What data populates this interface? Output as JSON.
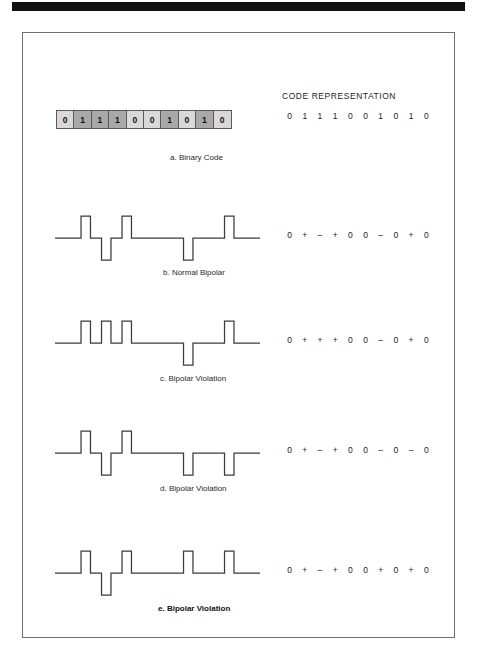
{
  "figure": {
    "top_rule": "black-rule",
    "code_representation_heading": "CODE REPRESENTATION"
  },
  "binary_code": {
    "bits": [
      "0",
      "1",
      "1",
      "1",
      "0",
      "0",
      "1",
      "0",
      "1",
      "0"
    ],
    "code_representation": [
      "0",
      "1",
      "1",
      "1",
      "0",
      "0",
      "1",
      "0",
      "1",
      "0"
    ],
    "caption": "a. Binary Code"
  },
  "panels": [
    {
      "id": "b",
      "caption": "b. Normal Bipolar",
      "symbols": [
        "0",
        "+",
        "–",
        "+",
        "0",
        "0",
        "–",
        "0",
        "+",
        "0"
      ],
      "levels": [
        0,
        1,
        -1,
        1,
        0,
        0,
        -1,
        0,
        1,
        0
      ]
    },
    {
      "id": "c",
      "caption": "c. Bipolar Violation",
      "symbols": [
        "0",
        "+",
        "+",
        "+",
        "0",
        "0",
        "–",
        "0",
        "+",
        "0"
      ],
      "levels": [
        0,
        1,
        1,
        1,
        0,
        0,
        -1,
        0,
        1,
        0
      ]
    },
    {
      "id": "d",
      "caption": "d. Bipolar Violation",
      "symbols": [
        "0",
        "+",
        "–",
        "+",
        "0",
        "0",
        "–",
        "0",
        "–",
        "0"
      ],
      "levels": [
        0,
        1,
        -1,
        1,
        0,
        0,
        -1,
        0,
        -1,
        0
      ]
    },
    {
      "id": "e",
      "caption": "e. Bipolar Violation",
      "symbols": [
        "0",
        "+",
        "–",
        "+",
        "0",
        "0",
        "+",
        "0",
        "+",
        "0"
      ],
      "levels": [
        0,
        1,
        -1,
        1,
        0,
        0,
        1,
        0,
        1,
        0
      ],
      "caption_bold": true
    }
  ],
  "colors": {
    "bit_zero_fill": "#d9d9d9",
    "bit_one_fill": "#a8a8a8",
    "frame_border": "#6f6f6f",
    "waveform_stroke": "#3b3b3b",
    "rule_black": "#111111"
  },
  "chart_data": {
    "type": "line",
    "categories": [
      "0",
      "1",
      "1",
      "1",
      "0",
      "0",
      "1",
      "0",
      "1",
      "0"
    ],
    "series": [
      {
        "name": "b. Normal Bipolar",
        "values": [
          0,
          1,
          -1,
          1,
          0,
          0,
          -1,
          0,
          1,
          0
        ]
      },
      {
        "name": "c. Bipolar Violation",
        "values": [
          0,
          1,
          1,
          1,
          0,
          0,
          -1,
          0,
          1,
          0
        ]
      },
      {
        "name": "d. Bipolar Violation",
        "values": [
          0,
          1,
          -1,
          1,
          0,
          0,
          -1,
          0,
          -1,
          0
        ]
      },
      {
        "name": "e. Bipolar Violation",
        "values": [
          0,
          1,
          -1,
          1,
          0,
          0,
          1,
          0,
          1,
          0
        ]
      }
    ],
    "xlabel": "",
    "ylabel": "",
    "ylim": [
      -1,
      1
    ],
    "grid": false,
    "legend": "none"
  }
}
